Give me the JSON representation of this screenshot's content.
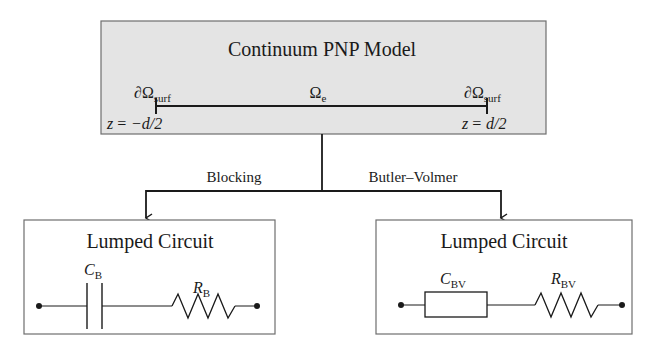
{
  "top_box": {
    "title": "Continuum PNP Model",
    "fill": "#e4e4e4",
    "left_boundary": {
      "symbol": "∂Ω",
      "subscript": "surf",
      "position_lhs": "z",
      "position_rhs": "= −d/2"
    },
    "domain": {
      "symbol": "Ω",
      "subscript": "e"
    },
    "right_boundary": {
      "symbol": "∂Ω",
      "subscript": "surf",
      "position_lhs": "z",
      "position_rhs": "= d/2"
    }
  },
  "branches": {
    "left_label": "Blocking",
    "right_label": "Butler–Volmer"
  },
  "left_circuit": {
    "title": "Lumped Circuit",
    "element1": {
      "symbol": "C",
      "subscript": "B",
      "type": "capacitor"
    },
    "element2": {
      "symbol": "R",
      "subscript": "B",
      "type": "resistor"
    }
  },
  "right_circuit": {
    "title": "Lumped Circuit",
    "element1": {
      "symbol": "C",
      "subscript": "BV",
      "type": "impedance-box"
    },
    "element2": {
      "symbol": "R",
      "subscript": "BV",
      "type": "resistor"
    }
  },
  "colors": {
    "stroke": "#1a1a1a",
    "box_border": "#6e6e6e",
    "top_fill": "#e4e4e4"
  }
}
